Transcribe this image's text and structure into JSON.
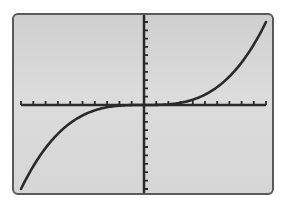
{
  "chart_data": {
    "type": "line",
    "title": "",
    "xlabel": "",
    "ylabel": "",
    "xlim": [
      -10,
      10
    ],
    "ylim": [
      -10,
      10
    ],
    "xscl": 1,
    "yscl": 1,
    "grid": false,
    "legend": null,
    "series": [
      {
        "name": "cubic",
        "function": "y = x^3 / 100",
        "x": [
          -10,
          -9,
          -8,
          -7,
          -6,
          -5,
          -4,
          -3,
          -2,
          -1,
          0,
          1,
          2,
          3,
          4,
          5,
          6,
          7,
          8,
          9,
          10
        ],
        "values": [
          -10,
          -7.29,
          -5.12,
          -3.43,
          -2.16,
          -1.25,
          -0.64,
          -0.27,
          -0.08,
          -0.01,
          0,
          0.01,
          0.08,
          0.27,
          0.64,
          1.25,
          2.16,
          3.43,
          5.12,
          7.29,
          10
        ]
      }
    ],
    "colors": {
      "curve": "#2a2a2a",
      "axes": "#2a2a2a",
      "screen_background": "#d6d6d6",
      "frame": "#5a5a5a"
    }
  },
  "screen": {
    "description": "graphing calculator screen"
  }
}
